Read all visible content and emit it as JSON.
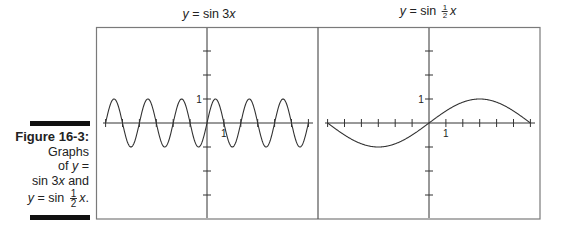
{
  "caption": {
    "figure_label": "Figure 16-3:",
    "line1": "Graphs",
    "line2_prefix": "of ",
    "line2_var": "y",
    "line2_suffix": " =",
    "line3_prefix": "sin 3",
    "line3_var": "x",
    "line3_suffix": " and",
    "line4_var": "y",
    "line4_mid": " = sin ",
    "line4_frac_num": "1",
    "line4_frac_den": "2",
    "line4_var2": "x",
    "line4_suffix": "."
  },
  "chart_data": [
    {
      "type": "line",
      "title": "y = sin 3x",
      "function": "sin(3x)",
      "x_range": [
        -6.2832,
        6.2832
      ],
      "x_tick_spacing": 1.0472,
      "x_ticks_each_side": 6,
      "y_ticks": [
        -3,
        -2,
        -1,
        1,
        2,
        3
      ],
      "x_label_tick": "1",
      "y_label_tick": "1",
      "ylim": [
        -4.1,
        4.1
      ],
      "grid": false,
      "series": [
        {
          "name": "sin 3x",
          "x": [
            -6.2832,
            -5.7596,
            -5.236,
            -4.7124,
            -4.1888,
            -3.6652,
            -3.1416,
            -2.618,
            -2.0944,
            -1.5708,
            -1.0472,
            -0.5236,
            0,
            0.5236,
            1.0472,
            1.5708,
            2.0944,
            2.618,
            3.1416,
            3.6652,
            4.1888,
            4.7124,
            5.236,
            5.7596,
            6.2832
          ],
          "values": [
            0,
            1,
            0,
            -1,
            0,
            1,
            0,
            -1,
            0,
            1,
            0,
            -1,
            0,
            1,
            0,
            -1,
            0,
            1,
            0,
            -1,
            0,
            1,
            0,
            -1,
            0
          ]
        }
      ]
    },
    {
      "type": "line",
      "title": "y = sin ½x",
      "function": "sin(x/2)",
      "x_range": [
        -6.2832,
        6.2832
      ],
      "x_tick_spacing": 1.0472,
      "x_ticks_each_side": 6,
      "y_ticks": [
        -3,
        -2,
        -1,
        1,
        2,
        3
      ],
      "x_label_tick": "1",
      "y_label_tick": "1",
      "ylim": [
        -4.1,
        4.1
      ],
      "grid": false,
      "series": [
        {
          "name": "sin ½x",
          "x": [
            -6.2832,
            -4.7124,
            -3.1416,
            -1.5708,
            0,
            1.5708,
            3.1416,
            4.7124,
            6.2832
          ],
          "values": [
            0,
            -0.7071,
            -1,
            -0.7071,
            0,
            0.7071,
            1,
            0.7071,
            0
          ]
        }
      ]
    }
  ],
  "titles": {
    "left_prefix_var": "y",
    "left_rest": " = sin 3",
    "left_var": "x",
    "right_prefix_var": "y",
    "right_rest": " = sin ",
    "right_frac_num": "1",
    "right_frac_den": "2",
    "right_var": "x"
  },
  "colors": {
    "frame": "#7a7a7a",
    "axis": "#333333",
    "curve": "#333333",
    "bar": "#111111"
  }
}
